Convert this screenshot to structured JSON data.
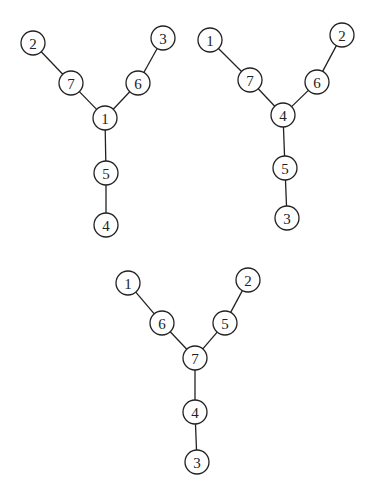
{
  "diagram": {
    "type": "tree-graphs",
    "node_radius": 12,
    "graphs": [
      {
        "id": "tree-a",
        "nodes": [
          {
            "label": "2",
            "x": 33,
            "y": 43
          },
          {
            "label": "7",
            "x": 71,
            "y": 83
          },
          {
            "label": "3",
            "x": 163,
            "y": 38
          },
          {
            "label": "6",
            "x": 138,
            "y": 83
          },
          {
            "label": "1",
            "x": 105,
            "y": 118
          },
          {
            "label": "5",
            "x": 106,
            "y": 173
          },
          {
            "label": "4",
            "x": 106,
            "y": 225
          }
        ],
        "edges": [
          [
            "2",
            "7"
          ],
          [
            "7",
            "1"
          ],
          [
            "3",
            "6"
          ],
          [
            "6",
            "1"
          ],
          [
            "1",
            "5"
          ],
          [
            "5",
            "4"
          ]
        ]
      },
      {
        "id": "tree-b",
        "nodes": [
          {
            "label": "1",
            "x": 210,
            "y": 40
          },
          {
            "label": "7",
            "x": 250,
            "y": 80
          },
          {
            "label": "2",
            "x": 342,
            "y": 35
          },
          {
            "label": "6",
            "x": 317,
            "y": 82
          },
          {
            "label": "4",
            "x": 283,
            "y": 115
          },
          {
            "label": "5",
            "x": 285,
            "y": 168
          },
          {
            "label": "3",
            "x": 287,
            "y": 218
          }
        ],
        "edges": [
          [
            "1",
            "7"
          ],
          [
            "7",
            "4"
          ],
          [
            "2",
            "6"
          ],
          [
            "6",
            "4"
          ],
          [
            "4",
            "5"
          ],
          [
            "5",
            "3"
          ]
        ]
      },
      {
        "id": "tree-c",
        "nodes": [
          {
            "label": "1",
            "x": 128,
            "y": 283
          },
          {
            "label": "6",
            "x": 162,
            "y": 323
          },
          {
            "label": "2",
            "x": 248,
            "y": 280
          },
          {
            "label": "5",
            "x": 225,
            "y": 323
          },
          {
            "label": "7",
            "x": 195,
            "y": 358
          },
          {
            "label": "4",
            "x": 195,
            "y": 412
          },
          {
            "label": "3",
            "x": 197,
            "y": 462
          }
        ],
        "edges": [
          [
            "1",
            "6"
          ],
          [
            "6",
            "7"
          ],
          [
            "2",
            "5"
          ],
          [
            "5",
            "7"
          ],
          [
            "7",
            "4"
          ],
          [
            "4",
            "3"
          ]
        ]
      }
    ]
  }
}
